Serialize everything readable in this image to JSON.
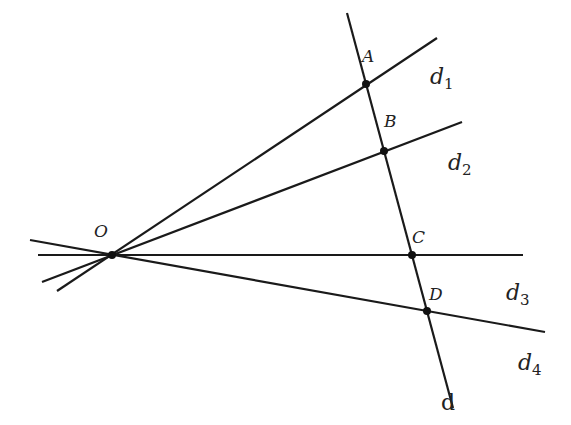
{
  "diagram": {
    "type": "geometry-figure",
    "stroke_color": "#1a1a1a",
    "origin": {
      "label": "O",
      "x": 112,
      "y": 255,
      "label_x": 94,
      "label_y": 237
    },
    "transversal": {
      "label": "d",
      "x1": 347,
      "y1": 13,
      "x2": 453,
      "y2": 408,
      "label_x": 441,
      "label_y": 410
    },
    "lines": [
      {
        "name": "d1",
        "label": "d",
        "sub": "1",
        "x1": 57,
        "y1": 291,
        "x2": 437,
        "y2": 38,
        "label_x": 430,
        "label_y": 84
      },
      {
        "name": "d2",
        "label": "d",
        "sub": "2",
        "x1": 42,
        "y1": 282,
        "x2": 462,
        "y2": 122,
        "label_x": 448,
        "label_y": 170
      },
      {
        "name": "d3",
        "label": "d",
        "sub": "3",
        "x1": 38,
        "y1": 255,
        "x2": 523,
        "y2": 255,
        "label_x": 506,
        "label_y": 300
      },
      {
        "name": "d4",
        "label": "d",
        "sub": "4",
        "x1": 30,
        "y1": 240,
        "x2": 545,
        "y2": 332,
        "label_x": 518,
        "label_y": 370
      }
    ],
    "points": [
      {
        "label": "A",
        "x": 366,
        "y": 84,
        "label_x": 362,
        "label_y": 62
      },
      {
        "label": "B",
        "x": 384,
        "y": 151,
        "label_x": 384,
        "label_y": 127
      },
      {
        "label": "C",
        "x": 412,
        "y": 255,
        "label_x": 412,
        "label_y": 243
      },
      {
        "label": "D",
        "x": 427,
        "y": 311,
        "label_x": 429,
        "label_y": 300
      }
    ]
  }
}
